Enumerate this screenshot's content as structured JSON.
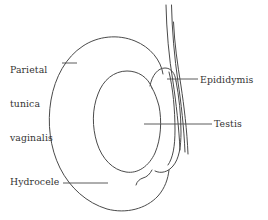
{
  "figure": {
    "background_color": "#ffffff",
    "stroke_color": "#4a4a4a",
    "text_color": "#333333"
  },
  "labels": {
    "parietal_tunica_vaginalis": {
      "line1": "Parietal",
      "line2": "tunica",
      "line3": "vaginalis",
      "full": "Parietal tunica vaginalis"
    },
    "epididymis": {
      "text": "Epididymis"
    },
    "testis": {
      "text": "Testis"
    },
    "hydrocele": {
      "text": "Hydrocele"
    }
  },
  "structures": [
    {
      "name": "spermatic-cord",
      "description": "three near-parallel lines descending from top right"
    },
    {
      "name": "hydrocele-sac",
      "description": "large outer fluid-filled sac outline"
    },
    {
      "name": "parietal-tunica-vaginalis",
      "description": "outer membrane layer of the sac"
    },
    {
      "name": "testis",
      "description": "large tilted oval body"
    },
    {
      "name": "epididymis",
      "description": "elongated crescent along the right margin of the testis"
    }
  ]
}
